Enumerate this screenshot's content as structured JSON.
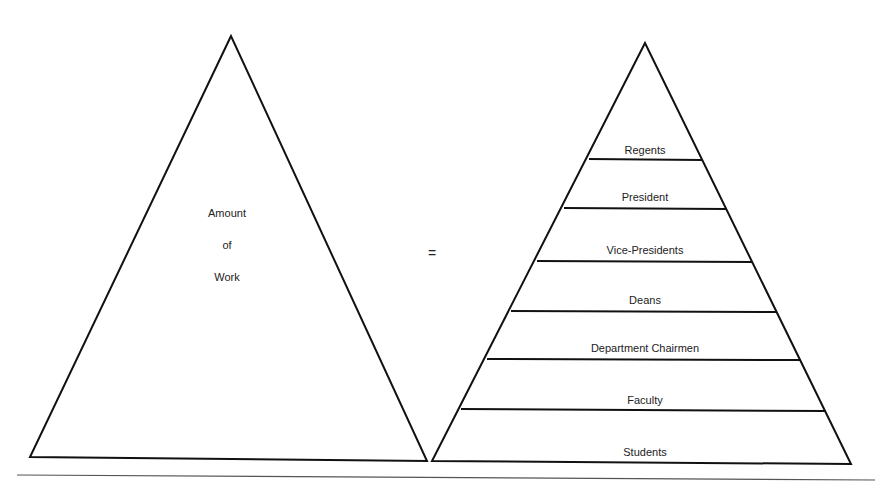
{
  "header": {
    "text": ""
  },
  "left_triangle": {
    "label_lines": [
      "Amount",
      "of",
      "Work"
    ]
  },
  "operator": "=",
  "right_triangle": {
    "levels": [
      "Regents",
      "President",
      "Vice-Presidents",
      "Deans",
      "Department Chairmen",
      "Faculty",
      "Students"
    ]
  }
}
